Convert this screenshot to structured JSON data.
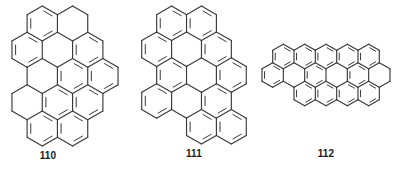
{
  "figure": {
    "type": "chemical-structure-set",
    "background_color": "#ffffff",
    "bond_color": "#3a3a3a",
    "label_color": "#1a1a1a"
  },
  "structures": [
    {
      "id": "110",
      "label": "110",
      "name": "structure-110",
      "shape": "elongated ribbon, diagonally fused rings running from upper right to lower right with stepped zigzag outline",
      "ring_count": 13,
      "geometry": {
        "hex_radius": 13.6,
        "orientation": "pointy-top",
        "cells": [
          [
            0,
            -3
          ],
          [
            1,
            -3
          ],
          [
            -1,
            -2
          ],
          [
            0,
            -2
          ],
          [
            1,
            -2
          ],
          [
            -1,
            -1
          ],
          [
            0,
            -1
          ],
          [
            1,
            -1
          ],
          [
            -2,
            0
          ],
          [
            -1,
            0
          ],
          [
            0,
            0
          ],
          [
            -2,
            1
          ],
          [
            -1,
            1
          ]
        ],
        "inner_bond_cells": [
          [
            0,
            -3
          ],
          [
            1,
            -2
          ],
          [
            0,
            -1
          ],
          [
            1,
            -1
          ],
          [
            -1,
            0
          ],
          [
            0,
            0
          ],
          [
            -2,
            1
          ],
          [
            -1,
            1
          ],
          [
            -1,
            -2
          ]
        ]
      }
    },
    {
      "id": "111",
      "label": "111",
      "name": "structure-111",
      "shape": "six-fold symmetric hexagonal disc, hexa-peri-benzocoronene type",
      "ring_count": 13,
      "geometry": {
        "hex_radius": 13.6,
        "orientation": "pointy-top",
        "cells": [
          [
            0,
            -2
          ],
          [
            1,
            -2
          ],
          [
            -1,
            -1
          ],
          [
            0,
            -1
          ],
          [
            1,
            -1
          ],
          [
            -1,
            0
          ],
          [
            0,
            0
          ],
          [
            1,
            0
          ],
          [
            -2,
            1
          ],
          [
            -1,
            1
          ],
          [
            0,
            1
          ],
          [
            -1,
            2
          ],
          [
            0,
            2
          ]
        ],
        "inner_bond_cells": [
          [
            0,
            -2
          ],
          [
            1,
            -2
          ],
          [
            -1,
            -1
          ],
          [
            1,
            -1
          ],
          [
            -1,
            0
          ],
          [
            1,
            0
          ],
          [
            -2,
            1
          ],
          [
            0,
            1
          ],
          [
            -1,
            2
          ],
          [
            0,
            2
          ]
        ]
      }
    },
    {
      "id": "112",
      "label": "112",
      "name": "structure-112",
      "shape": "wide flat oval, two stacked rows of fused rings with tapered ends",
      "ring_count": 13,
      "geometry": {
        "hex_radius": 13.6,
        "orientation": "pointy-top",
        "cells": [
          [
            0,
            -1
          ],
          [
            1,
            -1
          ],
          [
            2,
            -1
          ],
          [
            3,
            -1
          ],
          [
            4,
            -1
          ],
          [
            -1,
            0
          ],
          [
            0,
            0
          ],
          [
            1,
            0
          ],
          [
            2,
            0
          ],
          [
            3,
            0
          ],
          [
            4,
            0
          ],
          [
            0,
            1
          ],
          [
            1,
            1
          ],
          [
            2,
            1
          ],
          [
            3,
            1
          ]
        ],
        "inner_bond_cells": [
          [
            0,
            -1
          ],
          [
            1,
            -1
          ],
          [
            2,
            -1
          ],
          [
            3,
            -1
          ],
          [
            4,
            -1
          ],
          [
            -1,
            0
          ],
          [
            1,
            0
          ],
          [
            3,
            0
          ],
          [
            0,
            1
          ],
          [
            1,
            1
          ],
          [
            2,
            1
          ],
          [
            3,
            1
          ]
        ]
      }
    }
  ]
}
